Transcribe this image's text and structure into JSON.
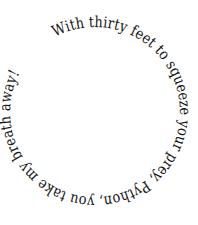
{
  "canvas": {
    "width": 198,
    "height": 225,
    "background_color": "#ffffff"
  },
  "artwork": {
    "type": "circular-text",
    "full_text": "With thirty feet to squeeze your prey, Python, you take my breath away!",
    "words": [
      "With",
      "thirty",
      "feet",
      "to",
      "squeeze",
      "your",
      "prey,",
      "Python,",
      "you",
      "take",
      "my",
      "breath",
      "away!"
    ],
    "text_color": "#141414",
    "font_size_px": 15.2,
    "path": {
      "shape": "circle",
      "center_x": 95,
      "center_y": 112,
      "radius": 85,
      "start_angle_deg": -118,
      "direction": "clockwise",
      "sweep_deg": 330,
      "baseline_side": "inside"
    }
  }
}
